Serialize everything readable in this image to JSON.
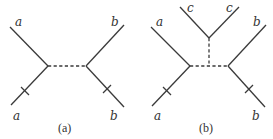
{
  "figure": {
    "panels": [
      {
        "id": "a",
        "caption": "(a)",
        "labels": {
          "upper_left": "a",
          "lower_left": "a",
          "upper_right": "b",
          "lower_right": "b"
        },
        "description": "Two vertices joined by a dashed propagator; external lines a (left) and b (right); ticks on lower-left and lower-right legs"
      },
      {
        "id": "b",
        "caption": "(b)",
        "labels": {
          "upper_left": "a",
          "lower_left": "a",
          "upper_right": "b",
          "lower_right": "b",
          "top_left": "c",
          "top_right": "c"
        },
        "description": "Same as (a) with an additional dashed vertical propagator from the horizontal dashed line to a vertex with two c lines"
      }
    ],
    "colors": {
      "line": "#3a3a3a",
      "text": "#333333",
      "background": "#ffffff"
    }
  }
}
